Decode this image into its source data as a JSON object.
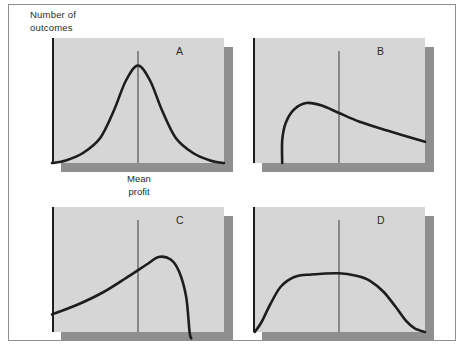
{
  "figure": {
    "y_axis_label": "Number of\noutcomes",
    "x_axis_label": "Mean\nprofit",
    "colors": {
      "panel-fill": "#d6d6d6",
      "panel-shadow": "#8f8f8f",
      "curve": "#1d1d1d",
      "mean-line": "#3a3a3a",
      "frame-border": "#8f8f8f",
      "text": "#2b2b2b",
      "background": "#ffffff"
    }
  },
  "chart_data": {
    "type": "line",
    "ylabel": "Number of outcomes",
    "xlabel": "Mean profit",
    "panels": [
      {
        "label": "A",
        "shape": "symmetric bell (normal distribution), peak centered on the mean line",
        "mean_line_x_pct": 50,
        "points_pct": [
          [
            0,
            0
          ],
          [
            8,
            2
          ],
          [
            18,
            8
          ],
          [
            28,
            20
          ],
          [
            36,
            42
          ],
          [
            43,
            66
          ],
          [
            50,
            78
          ],
          [
            57,
            66
          ],
          [
            64,
            42
          ],
          [
            72,
            20
          ],
          [
            82,
            8
          ],
          [
            92,
            2
          ],
          [
            100,
            0
          ]
        ]
      },
      {
        "label": "B",
        "shape": "right-skewed: steep rise near left axis, peak left of the mean line, long tail still elevated at right edge",
        "mean_line_x_pct": 50,
        "points_pct": [
          [
            17,
            0
          ],
          [
            17,
            18
          ],
          [
            19,
            32
          ],
          [
            24,
            43
          ],
          [
            31,
            48
          ],
          [
            40,
            46
          ],
          [
            50,
            40
          ],
          [
            62,
            33
          ],
          [
            78,
            26
          ],
          [
            100,
            17
          ]
        ]
      },
      {
        "label": "C",
        "shape": "left-skewed: gradual rise from elevated left edge, peak right of the mean line, steep drop to baseline",
        "mean_line_x_pct": 50,
        "points_pct": [
          [
            0,
            14
          ],
          [
            15,
            22
          ],
          [
            30,
            32
          ],
          [
            45,
            45
          ],
          [
            55,
            54
          ],
          [
            62,
            60
          ],
          [
            69,
            58
          ],
          [
            74,
            48
          ],
          [
            78,
            28
          ],
          [
            80,
            0
          ],
          [
            81,
            -5
          ]
        ]
      },
      {
        "label": "D",
        "shape": "flat-topped plateau (platykurtic), broad level top spanning the mean line, falling to baseline at both sides",
        "mean_line_x_pct": 50,
        "points_pct": [
          [
            1,
            0
          ],
          [
            5,
            8
          ],
          [
            10,
            22
          ],
          [
            16,
            36
          ],
          [
            24,
            44
          ],
          [
            34,
            46
          ],
          [
            50,
            47
          ],
          [
            60,
            45
          ],
          [
            68,
            41
          ],
          [
            76,
            32
          ],
          [
            83,
            20
          ],
          [
            89,
            9
          ],
          [
            94,
            3
          ],
          [
            100,
            0
          ]
        ]
      }
    ]
  }
}
